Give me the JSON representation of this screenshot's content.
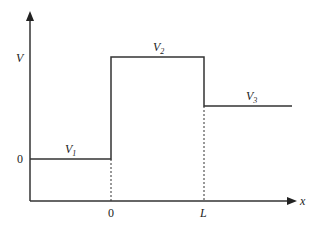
{
  "diagram": {
    "axes": {
      "y_label": "V",
      "x_label": "x",
      "y_tick_zero": "0",
      "x_ticks": [
        "0",
        "L"
      ]
    },
    "regions": [
      {
        "label": "V",
        "subscript": "1"
      },
      {
        "label": "V",
        "subscript": "2"
      },
      {
        "label": "V",
        "subscript": "3"
      }
    ],
    "colors": {
      "line": "#333333",
      "text": "#222222",
      "background": "#ffffff"
    }
  }
}
